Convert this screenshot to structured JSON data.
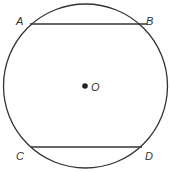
{
  "diagram": {
    "type": "circle-with-parallel-chords",
    "center_label": "O",
    "points": {
      "A": "A",
      "B": "B",
      "C": "C",
      "D": "D"
    },
    "chords": [
      "AB",
      "CD"
    ],
    "stroke_color": "#333333"
  }
}
